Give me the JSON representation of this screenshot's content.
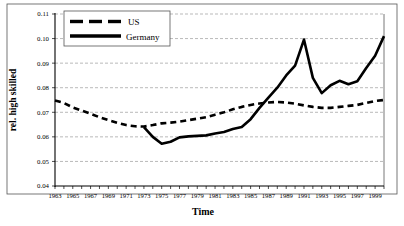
{
  "chart_data": {
    "type": "line",
    "title": "",
    "xlabel": "Time",
    "ylabel": "rel. high skilled",
    "xlim": [
      1963,
      2000
    ],
    "ylim": [
      0.04,
      0.11
    ],
    "ytick_labels": [
      "0.11",
      "0.10",
      "0.09",
      "0.08",
      "0.07",
      "0.06",
      "0.05",
      "0.04"
    ],
    "ytick_values": [
      0.11,
      0.1,
      0.09,
      0.08,
      0.07,
      0.06,
      0.05,
      0.04
    ],
    "xtick_labels": [
      "1963",
      "1965",
      "1967",
      "1969",
      "1971",
      "1973",
      "1975",
      "1977",
      "1979",
      "1981",
      "1983",
      "1985",
      "1987",
      "1989",
      "1991",
      "1993",
      "1995",
      "1997",
      "1999"
    ],
    "xtick_values": [
      1963,
      1965,
      1967,
      1969,
      1971,
      1973,
      1975,
      1977,
      1979,
      1981,
      1983,
      1985,
      1987,
      1989,
      1991,
      1993,
      1995,
      1997,
      1999
    ],
    "minor_tick_step": 1,
    "grid": "horizontal dashed gridlines only",
    "legend_position": "top-left inside plot",
    "x": [
      1963,
      1964,
      1965,
      1966,
      1967,
      1968,
      1969,
      1970,
      1971,
      1972,
      1973,
      1974,
      1975,
      1976,
      1977,
      1978,
      1979,
      1980,
      1981,
      1982,
      1983,
      1984,
      1985,
      1986,
      1987,
      1988,
      1989,
      1990,
      1991,
      1992,
      1993,
      1994,
      1995,
      1996,
      1997,
      1998,
      1999,
      2000
    ],
    "series": [
      {
        "name": "US",
        "style": "dashed",
        "color": "#000000",
        "values": [
          0.0748,
          0.0738,
          0.072,
          0.0707,
          0.0694,
          0.068,
          0.0668,
          0.0657,
          0.0648,
          0.0643,
          0.0642,
          0.0648,
          0.0655,
          0.0658,
          0.0662,
          0.0668,
          0.0674,
          0.068,
          0.069,
          0.07,
          0.0712,
          0.0722,
          0.073,
          0.0736,
          0.074,
          0.0742,
          0.074,
          0.0735,
          0.0728,
          0.0722,
          0.0718,
          0.0718,
          0.0722,
          0.0726,
          0.073,
          0.0738,
          0.0746,
          0.075
        ]
      },
      {
        "name": "Germany",
        "style": "solid",
        "color": "#000000",
        "values": [
          null,
          null,
          null,
          null,
          null,
          null,
          null,
          null,
          null,
          null,
          0.064,
          0.06,
          0.0572,
          0.058,
          0.0598,
          0.0602,
          0.0604,
          0.0606,
          0.0614,
          0.062,
          0.0632,
          0.064,
          0.0672,
          0.0718,
          0.076,
          0.08,
          0.085,
          0.089,
          0.0996,
          0.084,
          0.0778,
          0.081,
          0.0828,
          0.0814,
          0.0826,
          0.088,
          0.093,
          0.101
        ]
      }
    ]
  },
  "legend": {
    "entries": [
      {
        "label": "US",
        "style": "dashed"
      },
      {
        "label": "Germany",
        "style": "solid"
      }
    ]
  },
  "axes": {
    "x_title": "Time",
    "y_title": "rel. high skilled"
  }
}
